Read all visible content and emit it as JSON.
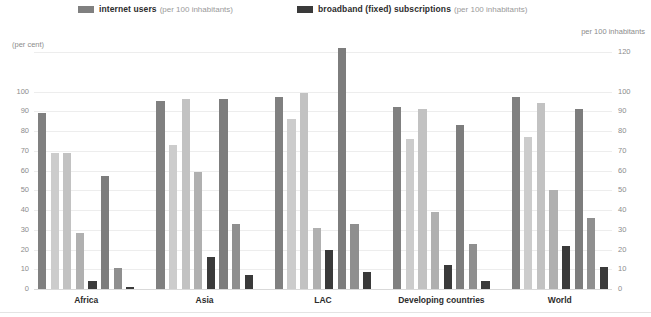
{
  "legend": [
    {
      "key": "internet-users",
      "strong": "internet users",
      "weak": "(per 100 inhabitants)",
      "color": "#808080"
    },
    {
      "key": "broadband-fixed",
      "strong": "broadband (fixed) subscriptions",
      "weak": "(per 100 inhabitants)",
      "color": "#3a3a3a"
    }
  ],
  "axes": {
    "left_caption": "(per cent)",
    "right_caption": "per 100 inhabitants",
    "left_ticks": [
      "100",
      "90",
      "80",
      "70",
      "60",
      "50",
      "40",
      "30",
      "20",
      "10",
      "0"
    ],
    "right_ticks": [
      "120",
      "100",
      "90",
      "80",
      "70",
      "60",
      "50",
      "40",
      "30",
      "20",
      "10",
      "0"
    ]
  },
  "chart_data": {
    "type": "bar",
    "title": "",
    "subtitle": "",
    "xlabel": "",
    "ylabel": "(per cent)",
    "y2label": "per 100 inhabitants",
    "ylim": [
      0,
      120
    ],
    "y2lim": [
      0,
      120
    ],
    "grid": true,
    "legend_position": "top",
    "categories": [
      "Africa",
      "Asia",
      "LAC",
      "Developing countries",
      "World"
    ],
    "series": [
      {
        "name": "bar-1",
        "color": "#808080",
        "values": [
          89,
          95,
          97,
          92,
          97
        ]
      },
      {
        "name": "bar-2",
        "color": "#cccccc",
        "values": [
          69,
          73,
          86,
          76,
          77
        ]
      },
      {
        "name": "bar-3",
        "color": "#c2c2c2",
        "values": [
          69,
          96,
          99,
          91,
          94
        ]
      },
      {
        "name": "bar-4",
        "color": "#b0b0b0",
        "values": [
          28.5,
          59,
          31,
          39,
          50
        ]
      },
      {
        "name": "broadband-a",
        "color": "#3a3a3a",
        "values": [
          4,
          16,
          20,
          12,
          22
        ]
      },
      {
        "name": "bar-6",
        "color": "#7d7d7d",
        "values": [
          57,
          96,
          122,
          83,
          91
        ]
      },
      {
        "name": "bar-7",
        "color": "#8f8f8f",
        "values": [
          10.5,
          33,
          33,
          23,
          36
        ]
      },
      {
        "name": "broadband-b",
        "color": "#3a3a3a",
        "values": [
          0.8,
          7,
          8.5,
          4,
          11
        ]
      }
    ]
  },
  "colors": {
    "gridline": "#ededed",
    "baseline": "#d9d9d9",
    "tick_text": "#8c8c8c",
    "label_text": "#2d2d2d",
    "background": "#ffffff"
  }
}
